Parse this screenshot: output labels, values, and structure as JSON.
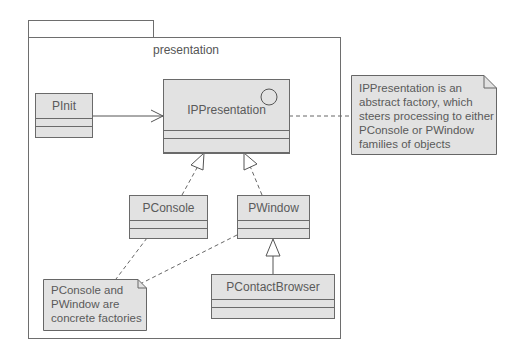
{
  "package": {
    "name": "presentation"
  },
  "classes": {
    "pinit": {
      "name": "PInit"
    },
    "ippresentation": {
      "name": "IPPresentation",
      "icon": "interface-circle-icon"
    },
    "pconsole": {
      "name": "PConsole"
    },
    "pwindow": {
      "name": "PWindow"
    },
    "pcontactbrowser": {
      "name": "PContactBrowser"
    }
  },
  "notes": {
    "abstract_factory": {
      "text": "IPPresentation is an\nabstract factory, which\nsteers processing to either\nPConsole or PWindow\nfamilies of objects"
    },
    "concrete_factories": {
      "text": "PConsole and\nPWindow are\nconcrete factories"
    }
  },
  "relationships": [
    {
      "from": "PInit",
      "to": "IPPresentation",
      "type": "association-arrow"
    },
    {
      "from": "PConsole",
      "to": "IPPresentation",
      "type": "realization"
    },
    {
      "from": "PWindow",
      "to": "IPPresentation",
      "type": "realization"
    },
    {
      "from": "PContactBrowser",
      "to": "PWindow",
      "type": "generalization"
    },
    {
      "from": "IPPresentation",
      "to": "note-abstract-factory",
      "type": "note-anchor"
    },
    {
      "from": "PConsole",
      "to": "note-concrete-factories",
      "type": "note-anchor"
    },
    {
      "from": "PWindow",
      "to": "note-concrete-factories",
      "type": "note-anchor"
    }
  ]
}
